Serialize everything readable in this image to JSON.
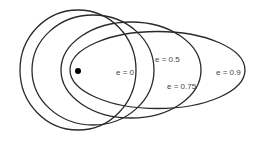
{
  "diagram": {
    "focus": {
      "cx": 78,
      "cy": 71,
      "r": 3,
      "color": "#000000"
    },
    "stroke_color": "#2a2a2a",
    "orbits": [
      {
        "label": "e = 0",
        "eccentricity": 0,
        "cx": 78,
        "cy": 70,
        "rx": 58,
        "ry": 60,
        "label_x": 116,
        "label_y": 75
      },
      {
        "label": "e = 0.5",
        "eccentricity": 0.5,
        "cx": 93,
        "cy": 70,
        "rx": 61,
        "ry": 55,
        "label_x": 155,
        "label_y": 62
      },
      {
        "label": "e = 0.75",
        "eccentricity": 0.75,
        "cx": 131,
        "cy": 70,
        "rx": 70,
        "ry": 48,
        "label_x": 167,
        "label_y": 89
      },
      {
        "label": "e = 0.9",
        "eccentricity": 0.9,
        "cx": 157.5,
        "cy": 70,
        "rx": 87.5,
        "ry": 38.5,
        "label_x": 216,
        "label_y": 75
      }
    ]
  }
}
